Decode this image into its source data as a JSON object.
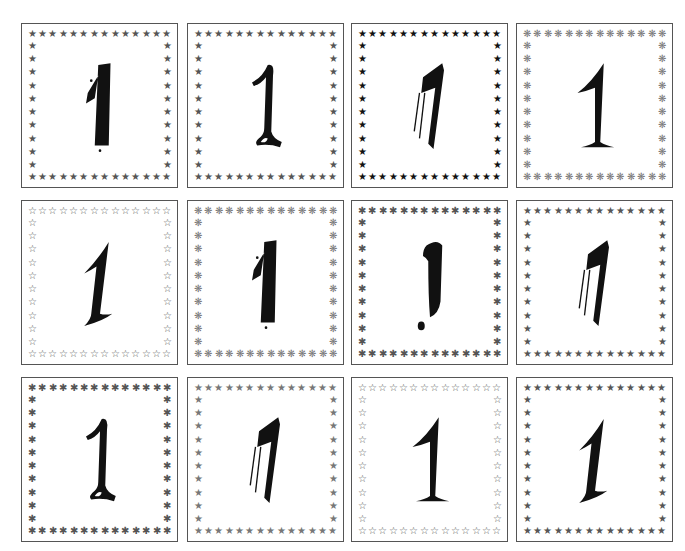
{
  "cards": [
    {
      "numeral": "1",
      "numeral_style": "brush-block",
      "ornament": "star-filled-gray",
      "ornament_char": "★",
      "ornament_tone": "mid"
    },
    {
      "numeral": "1",
      "numeral_style": "marker-script",
      "ornament": "star-filled-gray",
      "ornament_char": "★",
      "ornament_tone": "mid"
    },
    {
      "numeral": "1",
      "numeral_style": "speed-italic",
      "ornament": "star-filled-black",
      "ornament_char": "★",
      "ornament_tone": "dark"
    },
    {
      "numeral": "1",
      "numeral_style": "serif-flared",
      "ornament": "snowflake-asterisk",
      "ornament_char": "❋",
      "ornament_tone": "light"
    },
    {
      "numeral": "1",
      "numeral_style": "serif-italic",
      "ornament": "star-outline",
      "ornament_char": "☆",
      "ornament_tone": "mid"
    },
    {
      "numeral": "1",
      "numeral_style": "brush-block",
      "ornament": "snowflake-asterisk",
      "ornament_char": "❋",
      "ornament_tone": "light"
    },
    {
      "numeral": "1",
      "numeral_style": "marker-exclaim",
      "ornament": "asterisk",
      "ornament_char": "✱",
      "ornament_tone": "mid"
    },
    {
      "numeral": "1",
      "numeral_style": "speed-italic",
      "ornament": "star-filled-gray",
      "ornament_char": "★",
      "ornament_tone": "mid"
    },
    {
      "numeral": "1",
      "numeral_style": "marker-script",
      "ornament": "asterisk",
      "ornament_char": "✱",
      "ornament_tone": "mid"
    },
    {
      "numeral": "1",
      "numeral_style": "speed-italic",
      "ornament": "star-filled-gray",
      "ornament_char": "★",
      "ornament_tone": "light"
    },
    {
      "numeral": "1",
      "numeral_style": "serif-flared",
      "ornament": "star-outline",
      "ornament_char": "☆",
      "ornament_tone": "mid"
    },
    {
      "numeral": "1",
      "numeral_style": "serif-italic",
      "ornament": "star-filled-gray",
      "ornament_char": "★",
      "ornament_tone": "mid"
    }
  ],
  "layout": {
    "columns": [
      21,
      187,
      351,
      516
    ],
    "rows": [
      23,
      200,
      377
    ],
    "ornaments_per_row": 14,
    "ornaments_per_col": 12
  },
  "colors": {
    "card_border": "#555555",
    "numeral": "#111111",
    "background": "#ffffff"
  }
}
